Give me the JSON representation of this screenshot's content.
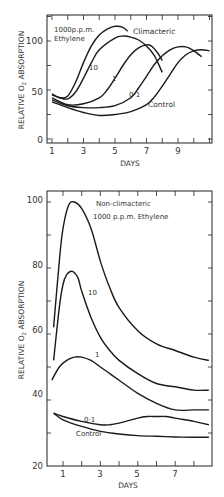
{
  "chart_data": [
    {
      "type": "line",
      "title": "Climacteric",
      "xlabel": "DAYS",
      "ylabel": "RELATIVE O2 ABSORPTION",
      "xlim": [
        0.7,
        11.3
      ],
      "ylim": [
        0,
        120
      ],
      "xticks": [
        1,
        3,
        5,
        7,
        9
      ],
      "yticks": [
        0,
        50,
        100
      ],
      "grid": false,
      "annotations": [
        "Climacteric",
        "1000p.p.m. Ethylene",
        "10",
        "1",
        "0·1",
        "Control"
      ],
      "series": [
        {
          "name": "1000 p.p.m. Ethylene",
          "x": [
            1,
            1.5,
            2,
            2.5,
            3,
            3.5,
            4,
            4.5,
            5,
            5.5,
            5.8
          ],
          "values": [
            46,
            42,
            44,
            58,
            78,
            95,
            106,
            112,
            115,
            114,
            110
          ]
        },
        {
          "name": "10",
          "x": [
            1,
            1.5,
            2,
            2.5,
            3,
            3.5,
            4,
            5,
            5.5,
            6,
            6.5,
            7,
            7.5,
            8
          ],
          "values": [
            45,
            42,
            41,
            48,
            62,
            78,
            91,
            103,
            105,
            104,
            101,
            95,
            85,
            68
          ]
        },
        {
          "name": "1",
          "x": [
            1,
            2,
            3,
            4,
            4.5,
            5,
            5.5,
            6,
            6.5,
            7,
            7.3,
            7.7,
            8
          ],
          "values": [
            42,
            35,
            36,
            42,
            50,
            62,
            75,
            86,
            93,
            96,
            95,
            88,
            80
          ]
        },
        {
          "name": "0·1",
          "x": [
            1,
            2,
            3,
            4,
            5,
            6,
            6.5,
            7,
            7.5,
            8,
            8.5,
            9,
            9.5,
            10,
            10.5
          ],
          "values": [
            40,
            34,
            32,
            32,
            34,
            42,
            52,
            64,
            76,
            85,
            91,
            94,
            94,
            90,
            84
          ]
        },
        {
          "name": "Control",
          "x": [
            1,
            2,
            3,
            4,
            5,
            6,
            7,
            7.5,
            8,
            8.5,
            9,
            9.5,
            10,
            10.5,
            11
          ],
          "values": [
            38,
            32,
            27,
            24,
            25,
            28,
            35,
            43,
            54,
            66,
            78,
            86,
            90,
            91,
            90
          ]
        }
      ]
    },
    {
      "type": "line",
      "title": "Non-climacteric",
      "xlabel": "DAYS",
      "ylabel": "RELATIVE O2 ABSORPTION",
      "xlim": [
        0.1,
        8.8
      ],
      "ylim": [
        20,
        102
      ],
      "xticks": [
        1,
        3,
        5,
        7
      ],
      "yticks": [
        20,
        40,
        60,
        80,
        100
      ],
      "grid": false,
      "annotations": [
        "Non-climacteric",
        "1000 p.p.m. Ethylene",
        "10",
        "1",
        "0·1",
        "Control"
      ],
      "series": [
        {
          "name": "1000 p.p.m. Ethylene",
          "x": [
            0.5,
            0.8,
            1,
            1.3,
            1.6,
            2,
            2.5,
            3,
            3.5,
            4,
            5,
            6,
            7,
            8,
            8.8
          ],
          "values": [
            62,
            82,
            92,
            99,
            100,
            98,
            92,
            82,
            74,
            68,
            61,
            57,
            55,
            53,
            52
          ]
        },
        {
          "name": "10",
          "x": [
            0.5,
            0.8,
            1,
            1.2,
            1.5,
            1.8,
            2,
            2.5,
            3,
            3.5,
            4,
            5,
            6,
            7,
            8,
            8.8
          ],
          "values": [
            52,
            68,
            75,
            78,
            79,
            77,
            73,
            65,
            59,
            55,
            52,
            48,
            45,
            44,
            43,
            43
          ]
        },
        {
          "name": "1",
          "x": [
            0.4,
            0.8,
            1.2,
            1.6,
            2,
            2.5,
            3,
            3.5,
            4,
            5,
            6,
            7,
            8,
            8.8
          ],
          "values": [
            46,
            50,
            52,
            53,
            53,
            52,
            50,
            48,
            46,
            42,
            39,
            37,
            37,
            37
          ]
        },
        {
          "name": "0·1",
          "x": [
            0.5,
            1,
            2,
            3,
            3.5,
            4,
            5,
            5.5,
            6,
            6.5,
            7,
            8,
            8.8
          ],
          "values": [
            36,
            35,
            33.5,
            32.5,
            32.5,
            33,
            34.5,
            35,
            35,
            35,
            34.5,
            33.5,
            32.5
          ]
        },
        {
          "name": "Control",
          "x": [
            0.5,
            1,
            2,
            3,
            4,
            5,
            6,
            7,
            8,
            8.8
          ],
          "values": [
            36,
            34,
            32,
            30.5,
            29.7,
            29.2,
            29,
            28.8,
            28.7,
            28.7
          ]
        }
      ]
    }
  ],
  "top": {
    "title": "Climacteric",
    "ylabel": "RELATIVE O",
    "ylabel_sub": "2",
    "ylabel_rest": " ABSORPTION",
    "xlabel": "DAYS",
    "yticks": [
      "0",
      "50",
      "100"
    ],
    "xticks": [
      "1",
      "3",
      "5",
      "7",
      "9"
    ],
    "labels": {
      "ethylene1": "1000p.p.m.",
      "ethylene2": "Ethylene",
      "c10": "10",
      "c1": "1",
      "c01": "0·1",
      "control": "Control"
    }
  },
  "bottom": {
    "title": "Non-climacteric",
    "subtitle": "1000 p.p.m. Ethylene",
    "ylabel": "RELATIVE O",
    "ylabel_sub": "2",
    "ylabel_rest": " ABSORPTION",
    "xlabel": "DAYS",
    "yticks": [
      "20",
      "40",
      "60",
      "80",
      "100"
    ],
    "xticks": [
      "1",
      "3",
      "5",
      "7"
    ],
    "labels": {
      "c10": "10",
      "c1": "1",
      "c01": "0·1",
      "control": "Control"
    }
  }
}
